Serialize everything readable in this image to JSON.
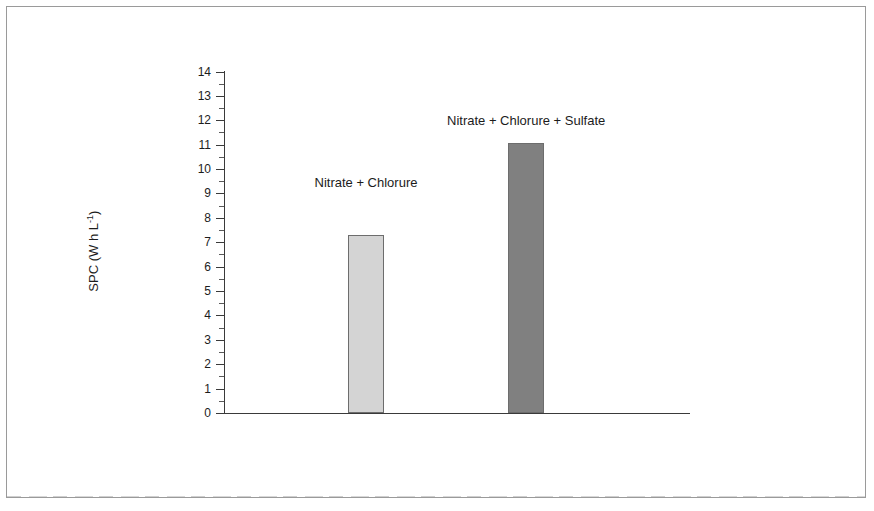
{
  "chart_data": {
    "type": "bar",
    "title": "",
    "subtitle": "",
    "xlabel": "",
    "ylabel": "SPC (W h L-1)",
    "ylabel_parts": {
      "prefix": "SPC (W h L",
      "superscript": "-1",
      "suffix": ")"
    },
    "categories": [
      "Nitrate + Chlorure",
      "Nitrate + Chlorure + Sulfate"
    ],
    "values": [
      7.3,
      11.05
    ],
    "ylim": [
      0,
      14
    ],
    "ytick_step": 1,
    "yticks": [
      "0",
      "1",
      "2",
      "3",
      "4",
      "5",
      "6",
      "7",
      "8",
      "9",
      "10",
      "11",
      "12",
      "13",
      "14"
    ],
    "minor_ticks": true,
    "grid": false,
    "legend": null,
    "bar_colors": [
      "#d4d4d4",
      "#808080"
    ],
    "bar_edge_color": "#6d6d6d",
    "axis_color": "#3a3a3a",
    "annotations": [
      {
        "text": "Nitrate + Chlorure",
        "for_bar": 0
      },
      {
        "text": "Nitrate + Chlorure + Sulfate",
        "for_bar": 1
      }
    ]
  },
  "frame": {
    "border_color": "#9a9a9a"
  }
}
